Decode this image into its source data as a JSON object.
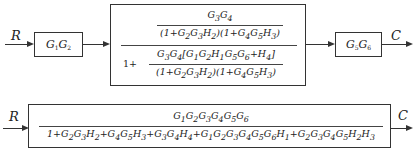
{
  "top_diagram": {
    "input_label": "R",
    "output_label": "C",
    "block1": {
      "label_html": "G<sub>1</sub>G<sub>2</sub>"
    },
    "block2": {
      "inner_numerator_html": "G<sub>3</sub>G<sub>4</sub>",
      "inner_denominator_html": "(1+G<sub>2</sub>G<sub>3</sub>H<sub>2</sub>)(1+G<sub>4</sub>G<sub>5</sub>H<sub>3</sub>)",
      "lower_prefix": "1+",
      "lower_numerator_html": "G<sub>3</sub>G<sub>4</sub>[G<sub>1</sub>G<sub>2</sub>H<sub>1</sub>G<sub>5</sub>G<sub>6</sub>+H<sub>4</sub>]",
      "lower_denominator_html": "(1+G<sub>2</sub>G<sub>3</sub>H<sub>2</sub>)(1+G<sub>4</sub>G<sub>5</sub>H<sub>3</sub>)"
    },
    "block3": {
      "label_html": "G<sub>5</sub>G<sub>6</sub>"
    }
  },
  "bottom_diagram": {
    "input_label": "R",
    "output_label": "C",
    "numerator_html": "G<sub>1</sub>G<sub>2</sub>G<sub>3</sub>G<sub>4</sub>G<sub>5</sub>G<sub>6</sub>",
    "denominator_html": "1+G<sub>2</sub>G<sub>3</sub>H<sub>2</sub>+G<sub>4</sub>G<sub>5</sub>H<sub>3</sub>+G<sub>3</sub>G<sub>4</sub>H<sub>4</sub>+G<sub>1</sub>G<sub>2</sub>G<sub>3</sub>G<sub>4</sub>G<sub>5</sub>G<sub>6</sub>H<sub>1</sub>+G<sub>2</sub>G<sub>3</sub>G<sub>4</sub>G<sub>5</sub>H<sub>2</sub>H<sub>3</sub>"
  }
}
